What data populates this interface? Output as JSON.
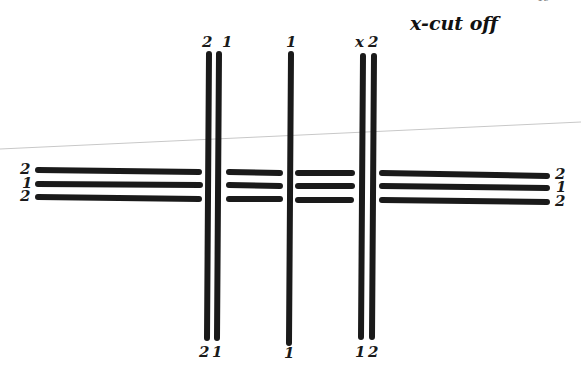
{
  "title": "x-cut off",
  "page_mark": "19",
  "vertical_threads": [
    {
      "id": "v1",
      "top_label": "2",
      "bottom_label": "2",
      "x": 208
    },
    {
      "id": "v2",
      "top_label": "1",
      "bottom_label": "1",
      "x": 218
    },
    {
      "id": "v3",
      "top_label": "1",
      "bottom_label": "1",
      "x": 290
    },
    {
      "id": "v4",
      "top_label": "x",
      "bottom_label": "1",
      "x": 363
    },
    {
      "id": "v5",
      "top_label": "2",
      "bottom_label": "2",
      "x": 373
    }
  ],
  "horizontal_threads": {
    "left_labels": [
      "2",
      "1",
      "2"
    ],
    "right_labels": [
      "2",
      "1",
      "2"
    ]
  },
  "colors": {
    "ink": "#1a1a1a",
    "guide_line": "#c8c8c8",
    "background": "#ffffff"
  }
}
